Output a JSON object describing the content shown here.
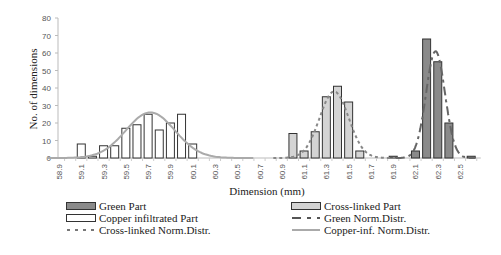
{
  "chart_data": {
    "type": "bar",
    "title": "",
    "xlabel": "Dimension (mm)",
    "ylabel": "No. of dimensions",
    "ylim": [
      0,
      80
    ],
    "yticks": [
      0,
      10,
      20,
      30,
      40,
      50,
      60,
      70,
      80
    ],
    "xtick_labels": [
      "58.9",
      "59.1",
      "59.3",
      "59.5",
      "59.7",
      "59.9",
      "60.1",
      "60.3",
      "60.5",
      "60.7",
      "60.9",
      "61.1",
      "61.3",
      "61.5",
      "61.7",
      "61.9",
      "62.1",
      "62.3",
      "62.5"
    ],
    "categories": [
      "58.9",
      "59.0",
      "59.1",
      "59.2",
      "59.3",
      "59.4",
      "59.5",
      "59.6",
      "59.7",
      "59.8",
      "59.9",
      "60.0",
      "60.1",
      "60.2",
      "60.3",
      "60.4",
      "60.5",
      "60.6",
      "60.7",
      "60.8",
      "60.9",
      "61.0",
      "61.1",
      "61.2",
      "61.3",
      "61.4",
      "61.5",
      "61.6",
      "61.7",
      "61.8",
      "61.9",
      "62.0",
      "62.1",
      "62.2",
      "62.3",
      "62.4",
      "62.5",
      "62.6"
    ],
    "grid": false,
    "legend_position": "bottom",
    "series": [
      {
        "name": "Green Part",
        "kind": "bar",
        "fill": "#8a8a8a",
        "values": {
          "61.9": 1,
          "62.1": 4,
          "62.2": 68,
          "62.3": 55,
          "62.4": 20,
          "62.6": 1
        }
      },
      {
        "name": "Copper infiltrated Part",
        "kind": "bar",
        "fill": "#ffffff",
        "values": {
          "59.1": 8,
          "59.2": 1,
          "59.3": 7,
          "59.4": 7,
          "59.5": 17,
          "59.6": 19,
          "59.7": 25,
          "59.8": 16,
          "59.9": 20,
          "60.0": 25,
          "60.1": 8
        }
      },
      {
        "name": "Cross-linked Part",
        "kind": "bar",
        "fill": "#d4d4d4",
        "values": {
          "61.0": 14,
          "61.1": 4,
          "61.2": 15,
          "61.3": 35,
          "61.4": 41,
          "61.5": 32,
          "61.6": 4
        }
      },
      {
        "name": "Green Norm.Distr.",
        "kind": "normal_curve",
        "mean": 62.28,
        "sd": 0.085,
        "peak": 61,
        "stroke": "#666666",
        "dash": "9,4,3,4"
      },
      {
        "name": "Cross-linked Norm.Distr.",
        "kind": "normal_curve",
        "mean": 61.37,
        "sd": 0.13,
        "peak": 38,
        "stroke": "#888888",
        "dash": "3,3"
      },
      {
        "name": "Copper-inf. Norm.Distr.",
        "kind": "normal_curve",
        "mean": 59.72,
        "sd": 0.22,
        "peak": 26,
        "stroke": "#aaaaaa",
        "dash": ""
      }
    ]
  },
  "legend": {
    "left": [
      {
        "label": "Green Part",
        "style": "box",
        "fill": "#8a8a8a"
      },
      {
        "label": "Copper infiltrated Part",
        "style": "box",
        "fill": "#ffffff"
      },
      {
        "label": "Cross-linked Norm.Distr.",
        "style": "dash",
        "stroke": "#888888"
      }
    ],
    "right": [
      {
        "label": "Cross-linked Part",
        "style": "box",
        "fill": "#d4d4d4"
      },
      {
        "label": "Green Norm.Distr.",
        "style": "dashdot",
        "stroke": "#666666"
      },
      {
        "label": "Copper-inf. Norm.Distr.",
        "style": "solid",
        "stroke": "#aaaaaa"
      }
    ]
  }
}
